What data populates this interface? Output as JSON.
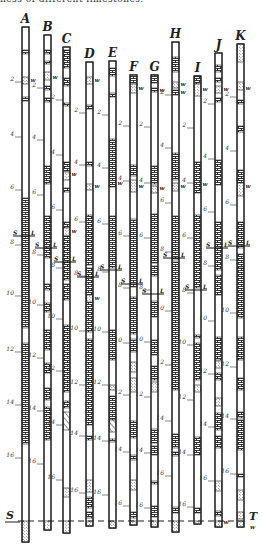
{
  "caption": "ness of different limestones.",
  "colors": {
    "ink": "#222222",
    "paper": "#ffffff"
  },
  "datum": {
    "left_label": "S",
    "right_label": "T",
    "right_sub": "w",
    "y": 521
  },
  "legend_symbols": {
    "L": "L",
    "S": "S",
    "w": "w"
  },
  "columns": [
    {
      "id": "A",
      "x": 22,
      "top": 27,
      "bottom": 542,
      "depths": [
        {
          "v": "2",
          "y": 82
        },
        {
          "v": "4",
          "y": 137
        },
        {
          "v": "6",
          "y": 190
        },
        {
          "v": "8",
          "y": 245
        },
        {
          "v": "10",
          "y": 296
        },
        {
          "v": "12",
          "y": 352
        },
        {
          "v": "14",
          "y": 405
        },
        {
          "v": "16",
          "y": 458
        }
      ],
      "segs": [
        [
          "b",
          50,
          54
        ],
        [
          "d",
          77,
          84
        ],
        [
          "b",
          97,
          101
        ],
        [
          "b",
          198,
          328
        ],
        [
          "b",
          343,
          444
        ],
        [
          "d",
          521,
          542
        ]
      ],
      "w": [
        {
          "y": 80
        }
      ],
      "sl": [
        {
          "y": 236,
          "dy": 3
        }
      ]
    },
    {
      "id": "B",
      "x": 44,
      "top": 35,
      "bottom": 530,
      "depths": [
        {
          "v": "2",
          "y": 88
        },
        {
          "v": "4",
          "y": 140
        },
        {
          "v": "6",
          "y": 195
        },
        {
          "v": "8",
          "y": 255
        },
        {
          "v": "10",
          "y": 305
        },
        {
          "v": "12",
          "y": 358
        },
        {
          "v": "14",
          "y": 411
        },
        {
          "v": "16",
          "y": 464
        }
      ],
      "segs": [
        [
          "b",
          50,
          54
        ],
        [
          "b",
          61,
          64
        ],
        [
          "d",
          72,
          80
        ],
        [
          "b",
          86,
          90
        ],
        [
          "b",
          98,
          102
        ],
        [
          "b",
          166,
          184
        ],
        [
          "b",
          216,
          258
        ],
        [
          "b",
          284,
          290
        ],
        [
          "b",
          303,
          312
        ],
        [
          "b",
          330,
          350
        ],
        [
          "b",
          363,
          373
        ],
        [
          "b",
          388,
          400
        ],
        [
          "b",
          407,
          440
        ],
        [
          "d",
          521,
          530
        ]
      ],
      "w": [
        {
          "y": 77
        }
      ],
      "sl": [
        {
          "y": 248,
          "dy": 3
        }
      ]
    },
    {
      "id": "C",
      "x": 63,
      "top": 47,
      "bottom": 533,
      "depths": [
        {
          "v": "2",
          "y": 100
        },
        {
          "v": "4",
          "y": 155
        },
        {
          "v": "6",
          "y": 210
        },
        {
          "v": "8",
          "y": 268
        },
        {
          "v": "10",
          "y": 319
        },
        {
          "v": "12",
          "y": 371
        },
        {
          "v": "14",
          "y": 425
        },
        {
          "v": "16",
          "y": 480
        }
      ],
      "segs": [
        [
          "b",
          50,
          68
        ],
        [
          "b",
          78,
          86
        ],
        [
          "b",
          103,
          106
        ],
        [
          "b",
          162,
          171
        ],
        [
          "d",
          172,
          180
        ],
        [
          "b",
          188,
          192
        ],
        [
          "b",
          222,
          228
        ],
        [
          "d",
          228,
          236
        ],
        [
          "b",
          236,
          280
        ],
        [
          "b",
          284,
          300
        ],
        [
          "b",
          325,
          392
        ],
        [
          "b",
          401,
          408
        ],
        [
          "h",
          412,
          430
        ],
        [
          "d",
          488,
          497
        ],
        [
          "d",
          521,
          533
        ]
      ],
      "w": [
        {
          "y": 174
        },
        {
          "y": 231
        }
      ],
      "sl": [
        {
          "y": 262,
          "dy": 3
        }
      ]
    },
    {
      "id": "D",
      "x": 86,
      "top": 62,
      "bottom": 526,
      "depths": [
        {
          "v": "2",
          "y": 113
        },
        {
          "v": "4",
          "y": 165
        },
        {
          "v": "6",
          "y": 222
        },
        {
          "v": "8",
          "y": 276
        },
        {
          "v": "10",
          "y": 331
        },
        {
          "v": "12",
          "y": 385
        },
        {
          "v": "14",
          "y": 436
        },
        {
          "v": "16",
          "y": 493
        }
      ],
      "segs": [
        [
          "d",
          77,
          84
        ],
        [
          "b",
          105,
          109
        ],
        [
          "b",
          162,
          166
        ],
        [
          "d",
          184,
          190
        ],
        [
          "b",
          215,
          265
        ],
        [
          "b",
          268,
          332
        ],
        [
          "d",
          295,
          302
        ],
        [
          "b",
          339,
          425
        ],
        [
          "b",
          436,
          440
        ],
        [
          "d",
          480,
          492
        ],
        [
          "b",
          497,
          508
        ],
        [
          "b",
          512,
          518
        ],
        [
          "d",
          521,
          526
        ]
      ],
      "w": [
        {
          "y": 80
        },
        {
          "y": 186
        },
        {
          "y": 298
        }
      ],
      "sl": [
        {
          "y": 277,
          "dy": 3
        }
      ]
    },
    {
      "id": "E",
      "x": 109,
      "top": 61,
      "bottom": 528,
      "depths": [
        {
          "v": "2",
          "y": 115
        },
        {
          "v": "4",
          "y": 168
        },
        {
          "v": "6",
          "y": 224
        },
        {
          "v": "8",
          "y": 272
        },
        {
          "v": "10",
          "y": 332
        },
        {
          "v": "12",
          "y": 385
        },
        {
          "v": "14",
          "y": 441
        },
        {
          "v": "16",
          "y": 495
        }
      ],
      "segs": [
        [
          "b",
          68,
          76
        ],
        [
          "b",
          93,
          97
        ],
        [
          "b",
          139,
          187
        ],
        [
          "b",
          216,
          268
        ],
        [
          "b",
          330,
          360
        ],
        [
          "d",
          385,
          390
        ],
        [
          "b",
          396,
          420
        ],
        [
          "h",
          420,
          432
        ],
        [
          "b",
          439,
          442
        ],
        [
          "d",
          521,
          528
        ]
      ],
      "w": [
        {
          "y": 183
        }
      ],
      "sl": [
        {
          "y": 270,
          "dy": 3
        }
      ]
    },
    {
      "id": "F",
      "x": 130,
      "top": 75,
      "bottom": 525,
      "depths": [
        {
          "v": "2",
          "y": 126
        },
        {
          "v": "4",
          "y": 181
        },
        {
          "v": "6",
          "y": 236
        },
        {
          "v": "8",
          "y": 288
        },
        {
          "v": "10",
          "y": 343
        },
        {
          "v": "12",
          "y": 395
        },
        {
          "v": "14",
          "y": 452
        },
        {
          "v": "16",
          "y": 506
        }
      ],
      "segs": [
        [
          "b",
          75,
          84
        ],
        [
          "d",
          84,
          93
        ],
        [
          "b",
          165,
          176
        ],
        [
          "d",
          180,
          192
        ],
        [
          "b",
          219,
          287
        ],
        [
          "b",
          297,
          334
        ],
        [
          "b",
          339,
          352
        ],
        [
          "d",
          362,
          372
        ],
        [
          "d",
          378,
          392
        ],
        [
          "b",
          421,
          438
        ],
        [
          "b",
          455,
          460
        ],
        [
          "d",
          480,
          490
        ],
        [
          "b",
          512,
          518
        ],
        [
          "d",
          521,
          525
        ]
      ],
      "w": [
        {
          "y": 88
        },
        {
          "y": 186
        }
      ],
      "sl": [
        {
          "y": 284,
          "dy": 3
        }
      ]
    },
    {
      "id": "G",
      "x": 151,
      "top": 75,
      "bottom": 527,
      "depths": [
        {
          "v": "2",
          "y": 127
        },
        {
          "v": "4",
          "y": 183
        },
        {
          "v": "6",
          "y": 238
        },
        {
          "v": "8",
          "y": 290
        },
        {
          "v": "10",
          "y": 342
        },
        {
          "v": "12",
          "y": 397
        },
        {
          "v": "14",
          "y": 453
        },
        {
          "v": "16",
          "y": 508
        }
      ],
      "segs": [
        [
          "b",
          75,
          83
        ],
        [
          "b",
          88,
          92
        ],
        [
          "b",
          166,
          184
        ],
        [
          "d",
          186,
          193
        ],
        [
          "b",
          214,
          263
        ],
        [
          "b",
          266,
          276
        ],
        [
          "b",
          301,
          317
        ],
        [
          "b",
          340,
          355
        ],
        [
          "b",
          366,
          380
        ],
        [
          "d",
          382,
          392
        ],
        [
          "b",
          429,
          443
        ],
        [
          "b",
          446,
          455
        ],
        [
          "b",
          481,
          484
        ],
        [
          "b",
          506,
          517
        ],
        [
          "d",
          521,
          527
        ]
      ],
      "w": [
        {
          "y": 90
        },
        {
          "y": 188
        }
      ],
      "sl": [
        {
          "y": 294,
          "dy": 3
        }
      ]
    },
    {
      "id": "H",
      "x": 172,
      "top": 42,
      "bottom": 532,
      "depths": [
        {
          "v": "2",
          "y": 95
        },
        {
          "v": "4",
          "y": 148
        },
        {
          "v": "6",
          "y": 203
        },
        {
          "v": "8",
          "y": 252
        },
        {
          "v": "10",
          "y": 311
        },
        {
          "v": "12",
          "y": 365
        },
        {
          "v": "14",
          "y": 421
        },
        {
          "v": "16",
          "y": 476
        }
      ],
      "segs": [
        [
          "b",
          57,
          72
        ],
        [
          "d",
          82,
          88
        ],
        [
          "b",
          90,
          95
        ],
        [
          "b",
          153,
          180
        ],
        [
          "d",
          183,
          191
        ],
        [
          "b",
          216,
          260
        ],
        [
          "b",
          262,
          390
        ],
        [
          "b",
          434,
          448
        ],
        [
          "b",
          452,
          456
        ],
        [
          "b",
          507,
          513
        ],
        [
          "d",
          521,
          532
        ]
      ],
      "w": [
        {
          "y": 84
        },
        {
          "y": 92
        },
        {
          "y": 186
        }
      ],
      "sl": [
        {
          "y": 258,
          "dy": 3
        }
      ]
    },
    {
      "id": "I",
      "x": 194,
      "top": 76,
      "bottom": 524,
      "depths": [
        {
          "v": "2",
          "y": 128
        },
        {
          "v": "4",
          "y": 183
        },
        {
          "v": "6",
          "y": 238
        },
        {
          "v": "8",
          "y": 293
        },
        {
          "v": "10",
          "y": 345
        },
        {
          "v": "12",
          "y": 400
        },
        {
          "v": "14",
          "y": 455
        },
        {
          "v": "16",
          "y": 507
        }
      ],
      "segs": [
        [
          "b",
          76,
          84
        ],
        [
          "d",
          84,
          96
        ],
        [
          "b",
          162,
          193
        ],
        [
          "b",
          215,
          288
        ],
        [
          "b",
          335,
          338
        ],
        [
          "b",
          343,
          380
        ],
        [
          "d",
          385,
          392
        ],
        [
          "b",
          437,
          455
        ],
        [
          "b",
          508,
          513
        ],
        [
          "d",
          521,
          524
        ]
      ],
      "w": [
        {
          "y": 89
        },
        {
          "y": 184
        }
      ],
      "sl": [
        {
          "y": 290,
          "dy": 3
        }
      ]
    },
    {
      "id": "J",
      "x": 215,
      "top": 53,
      "bottom": 527,
      "depths": [
        {
          "v": "2",
          "y": 104
        },
        {
          "v": "4",
          "y": 159
        },
        {
          "v": "6",
          "y": 212
        },
        {
          "v": "8",
          "y": 266
        },
        {
          "v": "10",
          "y": 321
        },
        {
          "v": "12",
          "y": 374
        },
        {
          "v": "14",
          "y": 427
        },
        {
          "v": "16",
          "y": 481
        }
      ],
      "segs": [
        [
          "b",
          65,
          72
        ],
        [
          "b",
          78,
          82
        ],
        [
          "d",
          86,
          93
        ],
        [
          "b",
          98,
          102
        ],
        [
          "b",
          160,
          185
        ],
        [
          "b",
          222,
          270
        ],
        [
          "b",
          275,
          295
        ],
        [
          "b",
          337,
          360
        ],
        [
          "d",
          361,
          368
        ],
        [
          "b",
          373,
          380
        ],
        [
          "d",
          398,
          406
        ],
        [
          "b",
          413,
          430
        ],
        [
          "b",
          436,
          448
        ],
        [
          "d",
          481,
          491
        ],
        [
          "b",
          511,
          516
        ],
        [
          "d",
          521,
          527
        ]
      ],
      "w": [
        {
          "y": 89
        },
        {
          "y": 522
        }
      ],
      "sl": [
        {
          "y": 248,
          "dy": 3
        }
      ]
    },
    {
      "id": "K",
      "x": 237,
      "top": 44,
      "bottom": 527,
      "depths": [
        {
          "v": "2",
          "y": 97
        },
        {
          "v": "4",
          "y": 151
        },
        {
          "v": "6",
          "y": 205
        },
        {
          "v": "8",
          "y": 260
        },
        {
          "v": "10",
          "y": 313
        },
        {
          "v": "12",
          "y": 367
        },
        {
          "v": "14",
          "y": 419
        },
        {
          "v": "16",
          "y": 474
        }
      ],
      "segs": [
        [
          "d",
          44,
          62
        ],
        [
          "d",
          82,
          90
        ],
        [
          "b",
          100,
          104
        ],
        [
          "b",
          126,
          132
        ],
        [
          "b",
          170,
          183
        ],
        [
          "d",
          183,
          196
        ],
        [
          "b",
          222,
          248
        ],
        [
          "b",
          254,
          270
        ],
        [
          "b",
          268,
          318
        ],
        [
          "b",
          337,
          360
        ],
        [
          "b",
          378,
          390
        ],
        [
          "b",
          412,
          418
        ],
        [
          "b",
          420,
          450
        ],
        [
          "b",
          474,
          477
        ],
        [
          "d",
          490,
          500
        ],
        [
          "d",
          512,
          519
        ],
        [
          "d",
          521,
          527
        ]
      ],
      "w": [
        {
          "y": 88
        },
        {
          "y": 186
        }
      ],
      "sl": [
        {
          "y": 246,
          "dy": 3
        }
      ]
    }
  ]
}
